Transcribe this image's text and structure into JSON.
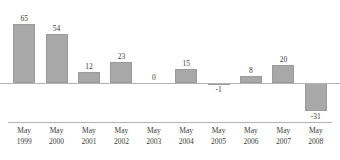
{
  "chart_data": {
    "type": "bar",
    "title": "",
    "subtitle": "",
    "xlabel": "",
    "ylabel": "",
    "categories": [
      "May 1999",
      "May 2000",
      "May 2001",
      "May 2002",
      "May 2003",
      "May 2004",
      "May 2005",
      "May 2006",
      "May 2007",
      "May 2008"
    ],
    "category_lines": [
      {
        "month": "May",
        "year": "1999"
      },
      {
        "month": "May",
        "year": "2000"
      },
      {
        "month": "May",
        "year": "2001"
      },
      {
        "month": "May",
        "year": "2002"
      },
      {
        "month": "May",
        "year": "2003"
      },
      {
        "month": "May",
        "year": "2004"
      },
      {
        "month": "May",
        "year": "2005"
      },
      {
        "month": "May",
        "year": "2006"
      },
      {
        "month": "May",
        "year": "2007"
      },
      {
        "month": "May",
        "year": "2008"
      }
    ],
    "values": [
      65,
      54,
      12,
      23,
      0,
      15,
      -1,
      8,
      20,
      -31
    ],
    "value_labels": [
      "65",
      "54",
      "12",
      "23",
      "0",
      "15",
      "-1",
      "8",
      "20",
      "-31"
    ],
    "ylim": [
      -35,
      70
    ],
    "grid": false,
    "legend": false,
    "legend_position": "none",
    "bar_color": "#a8a8a8",
    "axis_color": "#b2b2b2",
    "text_color": "#3b3b3b",
    "background_color": "#ffffff"
  }
}
